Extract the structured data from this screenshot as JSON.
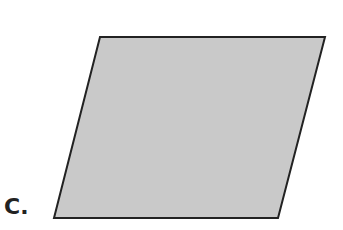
{
  "figure": {
    "label": "C.",
    "shape": "parallelogram",
    "vertices": [
      [
        100,
        37
      ],
      [
        325,
        37
      ],
      [
        278,
        218
      ],
      [
        54,
        218
      ]
    ],
    "fill_color": "#c9c9c9",
    "stroke_color": "#222222",
    "stroke_width": 2
  }
}
